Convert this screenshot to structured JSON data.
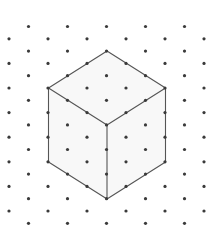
{
  "diagram": {
    "type": "isometric-dot-grid-cube",
    "background": "#ffffff",
    "grid": {
      "dot_color": "#3a3a3a",
      "dot_radius": 1.6,
      "col_spacing": 19.5,
      "row_spacing": 12.3,
      "origin_x": 9,
      "origin_y": 26.5,
      "rows": 17,
      "cols": 11
    },
    "cube": {
      "edge_color": "#555555",
      "edge_width": 1.1,
      "face_fill": "#f8f8f8",
      "vertices": {
        "top": [
          107,
          51
        ],
        "upper_left": [
          48.5,
          88
        ],
        "upper_right": [
          165.5,
          88
        ],
        "center": [
          107,
          125
        ],
        "lower_left": [
          48.5,
          162
        ],
        "lower_right": [
          165.5,
          162
        ],
        "bottom": [
          107,
          199
        ]
      }
    }
  }
}
